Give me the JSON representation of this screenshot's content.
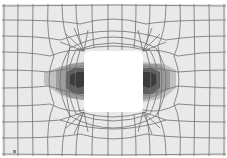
{
  "figure": {
    "title": "",
    "colors": {
      "background": "#e9e9e9",
      "mesh_line": "#6e6e6e",
      "hole": "#ffffff",
      "contour_low": "#c4c4c4",
      "contour_mid": "#9a9a9a",
      "contour_high": "#5a5a5a",
      "contour_peak": "#3a3a3a"
    },
    "hole": {
      "x": 84,
      "y": 51,
      "width": 59,
      "height": 61,
      "radius": 6
    },
    "corner_mark": "▪"
  }
}
